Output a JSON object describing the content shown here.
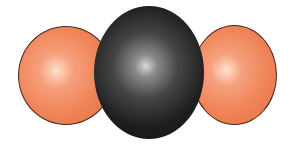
{
  "image": {
    "subject": "molecular model",
    "atoms": [
      {
        "id": "oxygen-left",
        "element": "O",
        "color": "#ef8558"
      },
      {
        "id": "carbon-center",
        "element": "C",
        "color": "#1e1e1e"
      },
      {
        "id": "oxygen-right",
        "element": "O",
        "color": "#ef8558"
      }
    ],
    "background": "#ffffff"
  }
}
